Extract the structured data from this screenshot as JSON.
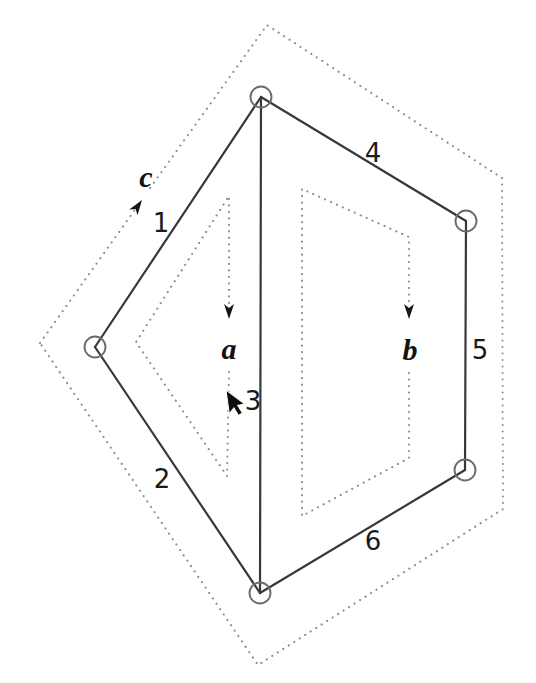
{
  "figure": {
    "type": "planar-graph-with-face-loops",
    "background": "#ffffff",
    "colors": {
      "edge": "#383838",
      "node_stroke": "#6b6b6b",
      "dotted_loop": "#8e8e8e",
      "label": "#1b1b1b",
      "arrowhead": "#161616",
      "cursor": "#0d0d0d"
    },
    "nodes": [
      {
        "id": "top",
        "x": 261,
        "y": 97
      },
      {
        "id": "left",
        "x": 95,
        "y": 347
      },
      {
        "id": "right-upper",
        "x": 466,
        "y": 221
      },
      {
        "id": "right-lower",
        "x": 465,
        "y": 470
      },
      {
        "id": "bottom",
        "x": 260,
        "y": 593
      }
    ],
    "edges": [
      {
        "label": "1",
        "from": "top",
        "to": "left",
        "label_x": 161,
        "label_y": 232
      },
      {
        "label": "2",
        "from": "left",
        "to": "bottom",
        "label_x": 162,
        "label_y": 488
      },
      {
        "label": "3",
        "from": "top",
        "to": "bottom",
        "label_x": 253,
        "label_y": 410
      },
      {
        "label": "4",
        "from": "top",
        "to": "right-upper",
        "label_x": 373,
        "label_y": 162
      },
      {
        "label": "5",
        "from": "right-upper",
        "to": "right-lower",
        "label_x": 480,
        "label_y": 359
      },
      {
        "label": "6",
        "from": "right-lower",
        "to": "bottom",
        "label_x": 373,
        "label_y": 550
      }
    ],
    "loops": [
      {
        "label": "a",
        "region": "inner-left-face",
        "direction": "clockwise",
        "label_x": 229,
        "label_y": 359
      },
      {
        "label": "b",
        "region": "inner-right-face",
        "direction": "clockwise",
        "label_x": 410,
        "label_y": 360
      },
      {
        "label": "c",
        "region": "outer-face",
        "direction": "clockwise",
        "label_x": 146,
        "label_y": 187
      }
    ],
    "cursor": {
      "icon": "mouse-pointer",
      "x": 226,
      "y": 390
    }
  }
}
